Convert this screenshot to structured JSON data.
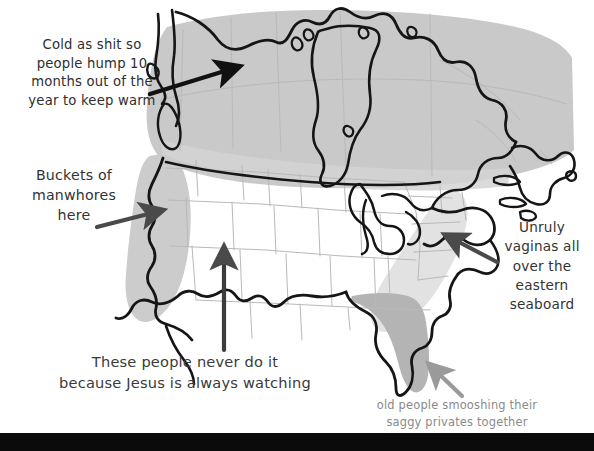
{
  "image": {
    "title": "Hand-annotated map of the United States and Canada",
    "width": 594,
    "height": 451,
    "background_color": "#ffffff",
    "bottom_band_color": "#0b0b0b"
  },
  "annotations": [
    {
      "id": "cold",
      "text": "Cold as shit so\npeople hump 10\nmonths out of the\nyear to keep warm",
      "color": "#2e2e2e",
      "points_to": "northern-plains-and-canada-region"
    },
    {
      "id": "buckets",
      "text": "Buckets of\nmanwhores\nhere",
      "color": "#333333",
      "points_to": "california-west-coast-region"
    },
    {
      "id": "unruly",
      "text": "Unruly\nvaginas all\nover the\neastern\nseaboard",
      "color": "#333333",
      "points_to": "eastern-seaboard-region"
    },
    {
      "id": "jesus",
      "text": "These people never do it\nbecause Jesus is always watching",
      "color": "#3a3a3a",
      "points_to": "southwest-interior-region"
    },
    {
      "id": "oldpeople",
      "text": "old people smooshing their\nsaggy privates together",
      "color": "#8a8a8a",
      "points_to": "florida-region"
    }
  ],
  "regions": [
    {
      "id": "northern-canada-shade",
      "label": "Canada and northern tier",
      "fill": "#c9c9c9"
    },
    {
      "id": "west-coast-shade",
      "label": "California / west coast",
      "fill": "#cccccc"
    },
    {
      "id": "eastern-seaboard-shade",
      "label": "Eastern seaboard",
      "fill": "#e0e0e0"
    },
    {
      "id": "florida-shade",
      "label": "Florida",
      "fill": "#b4b4b4"
    }
  ],
  "arrows": [
    {
      "id": "arrow-cold",
      "color": "#111111",
      "direction": "up-right"
    },
    {
      "id": "arrow-buckets",
      "color": "#4a4a4a",
      "direction": "right"
    },
    {
      "id": "arrow-jesus",
      "color": "#3c3c3c",
      "direction": "up"
    },
    {
      "id": "arrow-unruly",
      "color": "#4a4a4a",
      "direction": "up-left"
    },
    {
      "id": "arrow-oldpeople",
      "color": "#9a9a9a",
      "direction": "up-left"
    }
  ],
  "map": {
    "outline_color": "#151515",
    "state_border_color": "#b9b9b9",
    "country_name_primary": "United States",
    "country_name_secondary": "Canada"
  }
}
